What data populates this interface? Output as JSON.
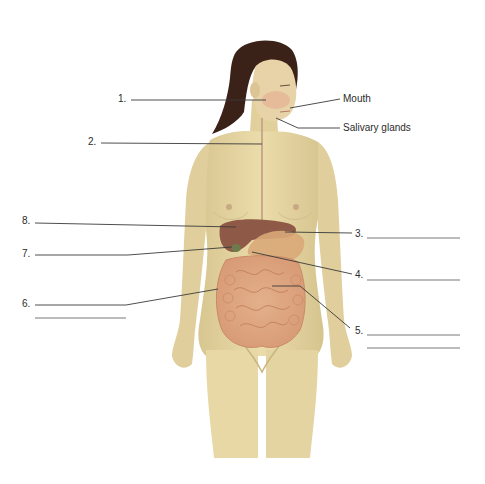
{
  "diagram": {
    "colors": {
      "background": "#ffffff",
      "skin": "#e6d7a6",
      "skin_shadow": "#cdbb86",
      "hair": "#3a2218",
      "liver": "#8e5a47",
      "stomach": "#d9a878",
      "intestine": "#dca27e",
      "leader_line": "#3a3a3a",
      "answer_line": "#6a6a6a"
    },
    "given_labels": [
      {
        "id": "mouth",
        "text": "Mouth"
      },
      {
        "id": "salivary",
        "text": "Salivary glands"
      }
    ],
    "numbered_labels": [
      {
        "number": "1.",
        "answer": ""
      },
      {
        "number": "2.",
        "answer": ""
      },
      {
        "number": "3.",
        "answer": ""
      },
      {
        "number": "4.",
        "answer": ""
      },
      {
        "number": "5.",
        "answer": ""
      },
      {
        "number": "6.",
        "answer": ""
      },
      {
        "number": "7.",
        "answer": ""
      },
      {
        "number": "8.",
        "answer": ""
      }
    ]
  }
}
